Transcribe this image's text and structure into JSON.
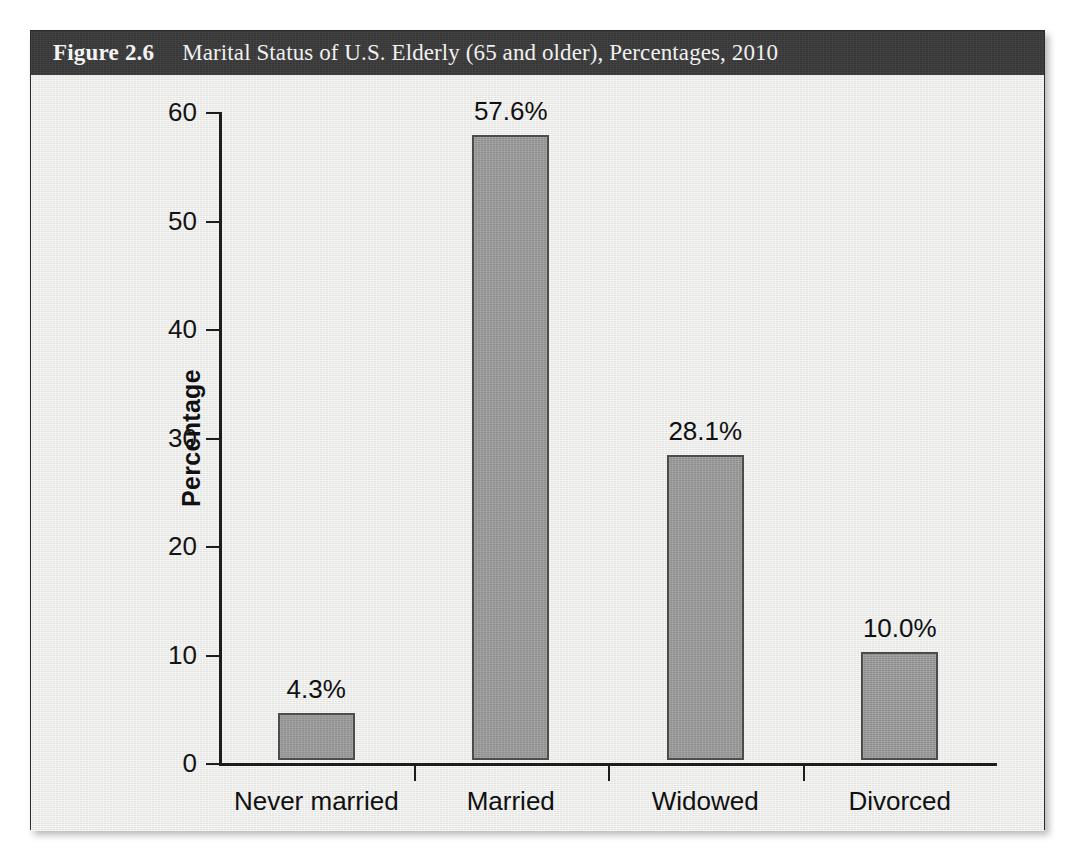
{
  "figure": {
    "number": "Figure 2.6",
    "title": "Marital Status of U.S. Elderly (65 and older), Percentages, 2010"
  },
  "colors": {
    "caption_bar": "#3a3a3a",
    "panel_background": "#eaeae8",
    "bar_fill": "#9d9d9d",
    "bar_border": "#4c4c4c",
    "axis": "#1d1d1d"
  },
  "chart_data": {
    "type": "bar",
    "title": "Marital Status of U.S. Elderly (65 and older), Percentages, 2010",
    "categories": [
      "Never married",
      "Married",
      "Widowed",
      "Divorced"
    ],
    "values": [
      4.3,
      57.6,
      28.1,
      10.0
    ],
    "value_labels": [
      "4.3%",
      "57.6%",
      "28.1%",
      "10.0%"
    ],
    "xlabel": "",
    "ylabel": "Percentage",
    "ylim": [
      0,
      60
    ],
    "yticks": [
      0,
      10,
      20,
      30,
      40,
      50,
      60
    ],
    "ytick_labels": [
      "0",
      "10",
      "20",
      "30",
      "40",
      "50",
      "60"
    ],
    "grid": false,
    "legend": false
  }
}
